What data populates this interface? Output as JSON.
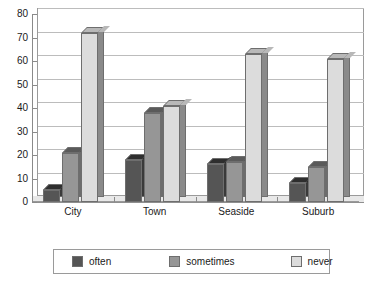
{
  "chart_data": {
    "type": "bar",
    "title": "",
    "subtitle": "",
    "xlabel": "",
    "ylabel": "",
    "ylim": [
      0,
      80
    ],
    "ytick_step": 10,
    "yticks": [
      0,
      10,
      20,
      30,
      40,
      50,
      60,
      70,
      80
    ],
    "grid": true,
    "legend_position": "bottom",
    "style": "3d-clustered-column",
    "categories": [
      "City",
      "Town",
      "Seaside",
      "Suburb"
    ],
    "series": [
      {
        "name": "often",
        "color": "#555555",
        "values": [
          5,
          18,
          16,
          8
        ]
      },
      {
        "name": "sometimes",
        "color": "#969696",
        "values": [
          21,
          38,
          17,
          15
        ]
      },
      {
        "name": "never",
        "color": "#dcdcdc",
        "values": [
          72,
          41,
          63,
          61
        ]
      }
    ]
  },
  "legend": {
    "items": [
      {
        "label": "often"
      },
      {
        "label": "sometimes"
      },
      {
        "label": "never"
      }
    ]
  },
  "colors": {
    "plot_background": "#ffffff",
    "gridline": "#bcbcbc",
    "axis": "#8a8a8a",
    "text": "#1a1a1a"
  }
}
